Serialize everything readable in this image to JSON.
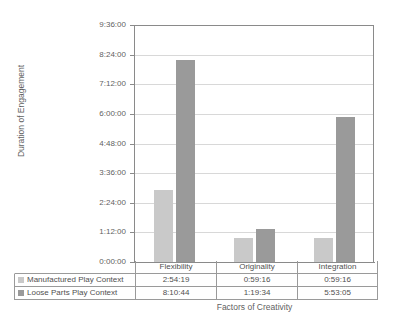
{
  "chart_data": {
    "type": "bar",
    "title": "",
    "xlabel": "Factors of Creativity",
    "ylabel": "Duration of Engagement",
    "categories": [
      "Flexibility",
      "Originality",
      "Integration"
    ],
    "ytick_labels": [
      "0:00:00",
      "1:12:00",
      "2:24:00",
      "3:36:00",
      "4:48:00",
      "6:00:00",
      "7:12:00",
      "8:24:00",
      "9:36:00"
    ],
    "ytick_values_hours": [
      0,
      1.2,
      2.4,
      3.6,
      4.8,
      6.0,
      7.2,
      8.4,
      9.6
    ],
    "ylim_hours": [
      0,
      9.6
    ],
    "grid": true,
    "legend_position": "data-table-below",
    "series": [
      {
        "name": "Manufactured Play Context",
        "color": "#c9c9c9",
        "values": [
          "2:54:19",
          "0:59:16",
          "0:59:16"
        ],
        "values_hours": [
          2.9053,
          0.9878,
          0.9878
        ]
      },
      {
        "name": "Loose Parts Play Context",
        "color": "#9a9a9a",
        "values": [
          "8:10:44",
          "1:19:34",
          "5:53:05"
        ],
        "values_hours": [
          8.1789,
          1.3261,
          5.8847
        ]
      }
    ]
  },
  "table": {
    "corner_label": "",
    "header_row": [
      "Flexibility",
      "Originality",
      "Integration"
    ],
    "rows": [
      {
        "label": "Manufactured Play Context",
        "swatch": "#c9c9c9",
        "cells": [
          "2:54:19",
          "0:59:16",
          "0:59:16"
        ]
      },
      {
        "label": "Loose Parts Play Context",
        "swatch": "#9a9a9a",
        "cells": [
          "8:10:44",
          "1:19:34",
          "5:53:05"
        ]
      }
    ]
  },
  "style": {
    "axis_color": "#8a8a8a",
    "grid_color": "#d8d8d8",
    "table_border": "#9a9a9a",
    "text_color": "#5a5a5a",
    "background": "#ffffff"
  }
}
